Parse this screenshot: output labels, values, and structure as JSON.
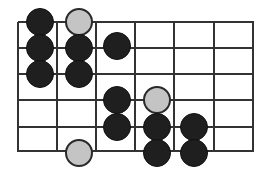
{
  "diagram": {
    "type": "go-board-fragment",
    "colors": {
      "grid": "#333333",
      "black_stone": "#1f1f1f",
      "gray_stone": "#c4c4c4",
      "background": "#ffffff"
    },
    "grid": {
      "vertical_lines_x": [
        18,
        57,
        96,
        135,
        174,
        214,
        253
      ],
      "horizontal_lines_y": [
        22,
        48,
        74,
        100,
        127,
        151
      ],
      "x_range": [
        18,
        253
      ],
      "y_range": [
        22,
        151
      ]
    },
    "stone_radius": 14,
    "stones": [
      {
        "color": "black",
        "x": 40,
        "y": 22
      },
      {
        "color": "gray",
        "x": 79,
        "y": 22
      },
      {
        "color": "black",
        "x": 40,
        "y": 48
      },
      {
        "color": "black",
        "x": 79,
        "y": 48
      },
      {
        "color": "black",
        "x": 117,
        "y": 46
      },
      {
        "color": "black",
        "x": 40,
        "y": 74
      },
      {
        "color": "black",
        "x": 79,
        "y": 74
      },
      {
        "color": "black",
        "x": 117,
        "y": 100
      },
      {
        "color": "gray",
        "x": 157,
        "y": 100
      },
      {
        "color": "black",
        "x": 117,
        "y": 127
      },
      {
        "color": "black",
        "x": 157,
        "y": 127
      },
      {
        "color": "black",
        "x": 194,
        "y": 127
      },
      {
        "color": "gray",
        "x": 79,
        "y": 153
      },
      {
        "color": "black",
        "x": 157,
        "y": 153
      },
      {
        "color": "black",
        "x": 194,
        "y": 153
      }
    ]
  }
}
